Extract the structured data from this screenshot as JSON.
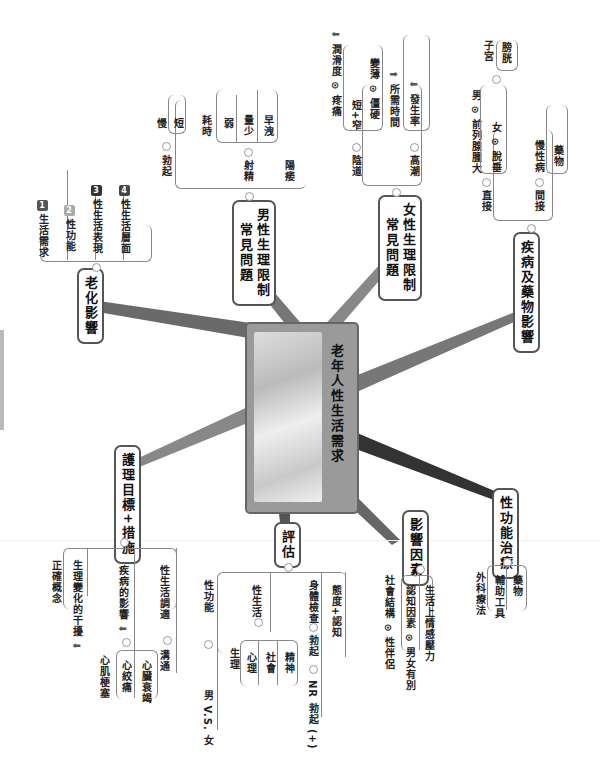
{
  "center": {
    "title": "老年人性生活需求",
    "image": "elderly-couple-photo"
  },
  "branches": {
    "aging": {
      "label": "老化影響",
      "items": [
        {
          "num": "1",
          "text": "生活需求",
          "color": "#555555"
        },
        {
          "num": "2",
          "text": "性功能",
          "color": "#aaaaaa"
        },
        {
          "num": "3",
          "text": "性生活表現",
          "color": "#333333"
        },
        {
          "num": "4",
          "text": "性生活層面",
          "color": "#444444"
        }
      ]
    },
    "male": {
      "label": "男性生理限制常見問題",
      "line1": "男性生理限制",
      "line2": "常見問題",
      "erection": {
        "label": "勃起",
        "items": [
          "慢",
          "短"
        ]
      },
      "ejaculation": {
        "label": "射精",
        "time": "耗時",
        "items": [
          "弱",
          "量少",
          "早洩"
        ]
      },
      "impotence": "陽痿"
    },
    "female": {
      "label": "女性生理限制常見問題",
      "line1": "女性生理限制",
      "line2": "常見問題",
      "vagina": {
        "label": "陰道",
        "lubrication": "潤滑度",
        "pain": "疼痛",
        "short": "短+窄",
        "thin": "變薄",
        "stiff": "僵硬"
      },
      "orgasm": {
        "label": "高潮",
        "time": "所需時間",
        "rate": "發生率"
      }
    },
    "disease": {
      "label": "疾病及藥物影響",
      "direct": {
        "label": "直接",
        "male": "男",
        "male_item": "前列腺腫大",
        "female": "女",
        "female_item": "脫垂",
        "uterus": "子宮",
        "bladder": "膀胱"
      },
      "indirect": {
        "label": "間接",
        "chronic": "慢性病",
        "drugs": "藥物"
      }
    },
    "treatment": {
      "label": "性功能治療",
      "items": [
        "外科療法",
        "輔助工具",
        "藥物"
      ]
    },
    "factors": {
      "label": "影響因素",
      "partner": "性伴侶",
      "social": "社會結構",
      "gender": "男女有別",
      "cognitive": "認知因素",
      "stress": "生活上情感壓力"
    },
    "assessment": {
      "label": "評估",
      "sexfunc": "性功能",
      "mvf": "男 V.S. 女",
      "sexlife": "性生活",
      "sexlife_items": [
        "生理",
        "心理",
        "社會",
        "精神"
      ],
      "exam": "身體檢查",
      "erect": "勃起",
      "nr": "NR 勃起 (+)",
      "attitude": "態度+認知"
    },
    "care": {
      "label": "護理目標+措施",
      "concept": "正確概念",
      "intervene": "生理變化的干擾",
      "disease_effect": "疾病的影響",
      "mi": "心肌梗塞",
      "angina": "心絞痛",
      "hf": "心臟衰竭",
      "communicate": "溝通",
      "alt": "性生活調適"
    }
  },
  "colors": {
    "spoke": "#555555",
    "spoke_light": "#888888",
    "border": "#555555"
  }
}
